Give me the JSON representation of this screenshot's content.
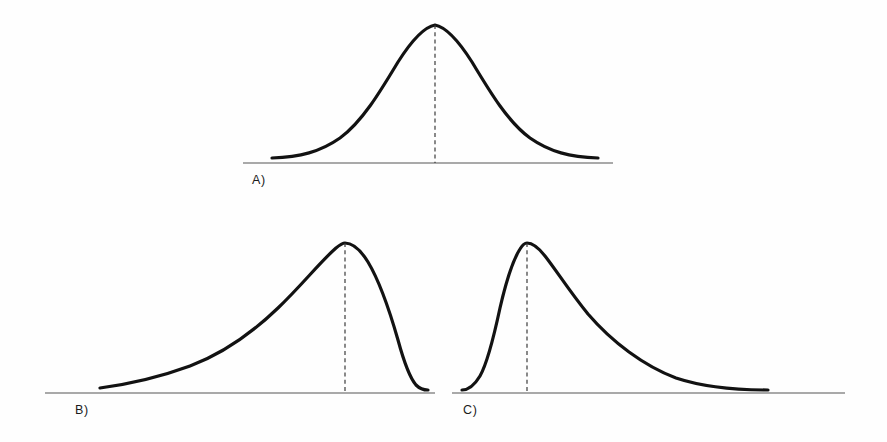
{
  "figure": {
    "title": "",
    "background_color": "#fefefe",
    "curve_color": "#121212",
    "axis_color": "#8d8d8d",
    "dash_color": "#333333",
    "panel_count": 3
  },
  "panels": [
    {
      "id": "A",
      "label": "A)",
      "shape": "symmetric-bell",
      "skew": "none",
      "description": "Symmetric normal distribution curve with dashed vertical center line at the peak",
      "label_x": 252,
      "label_y": 184,
      "axis": {
        "x1": 243,
        "x2": 613,
        "y": 163
      },
      "peak": {
        "x": 435,
        "y": 25
      },
      "dash": {
        "x": 435,
        "y_top": 25,
        "y_bottom": 163
      },
      "curve": "M 272 158 C 300 157 320 152 340 138 C 362 122 380 92 398 62 C 412 40 424 27 435 25 C 446 27 458 40 472 62 C 490 92 508 122 530 138 C 550 152 570 157 598 158"
    },
    {
      "id": "B",
      "label": "B)",
      "shape": "left-skewed",
      "skew": "negative",
      "description": "Negatively skewed distribution with a long tail extending to the left and a steep drop on the right",
      "label_x": 75,
      "label_y": 414,
      "axis": {
        "x1": 45,
        "x2": 435,
        "y": 393
      },
      "peak": {
        "x": 345,
        "y": 243
      },
      "dash": {
        "x": 345,
        "y_top": 243,
        "y_bottom": 393
      },
      "curve": "M 100 388 C 130 384 160 377 190 366 C 222 354 252 333 278 308 C 302 285 320 262 336 248 C 341 244 343 243 345 243 C 352 243 360 249 368 262 C 380 282 390 312 398 340 C 404 362 410 378 416 385 C 420 389 424 390 428 390"
    },
    {
      "id": "C",
      "label": "C)",
      "shape": "right-skewed",
      "skew": "positive",
      "description": "Positively skewed distribution with a steep rise on the left and a long tail extending to the right",
      "label_x": 463,
      "label_y": 414,
      "axis": {
        "x1": 452,
        "x2": 845,
        "y": 393
      },
      "peak": {
        "x": 527,
        "y": 243
      },
      "dash": {
        "x": 527,
        "y_top": 243,
        "y_bottom": 393
      },
      "curve": "M 462 390 C 468 390 474 386 480 376 C 488 362 494 336 500 308 C 506 282 513 260 520 249 C 523 244 525 243 527 243 C 532 243 538 247 545 256 C 556 270 570 292 588 314 C 612 342 644 366 676 378 C 706 388 740 390 768 390"
    }
  ]
}
